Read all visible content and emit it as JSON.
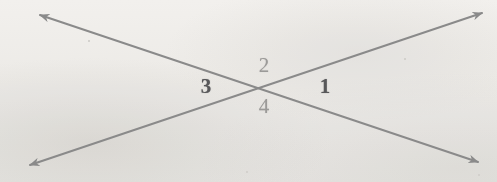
{
  "figure": {
    "background_color": "#f6f5f3",
    "width": 497,
    "height": 182
  },
  "geometry": {
    "intersection": {
      "x": 262,
      "y": 85
    },
    "line_color": "#8a8a8a",
    "line_width": 2,
    "lines": [
      {
        "name": "line-nw-se",
        "from": {
          "x": 40,
          "y": 15
        },
        "to": {
          "x": 478,
          "y": 162
        },
        "arrow_start": true,
        "arrow_end": true
      },
      {
        "name": "line-sw-ne",
        "from": {
          "x": 30,
          "y": 165
        },
        "to": {
          "x": 482,
          "y": 13
        },
        "arrow_start": true,
        "arrow_end": true
      }
    ],
    "arrowheads": [
      {
        "name": "arrowhead-top-left",
        "x": 40,
        "y": 15,
        "direction": "up-left"
      },
      {
        "name": "arrowhead-top-right",
        "x": 482,
        "y": 13,
        "direction": "up-right"
      },
      {
        "name": "arrowhead-bottom-left",
        "x": 30,
        "y": 165,
        "direction": "down-left"
      },
      {
        "name": "arrowhead-bottom-right",
        "x": 478,
        "y": 162,
        "direction": "down-right"
      }
    ]
  },
  "labels": [
    {
      "name": "angle-label-2",
      "text": "2",
      "x": 264,
      "y": 65,
      "style": "light",
      "color": "#9b9a98"
    },
    {
      "name": "angle-label-3",
      "text": "3",
      "x": 206,
      "y": 86,
      "style": "dark",
      "color": "#58585a"
    },
    {
      "name": "angle-label-1",
      "text": "1",
      "x": 325,
      "y": 86,
      "style": "dark",
      "color": "#58585a"
    },
    {
      "name": "angle-label-4",
      "text": "4",
      "x": 264,
      "y": 106,
      "style": "light",
      "color": "#9b9a98"
    }
  ]
}
